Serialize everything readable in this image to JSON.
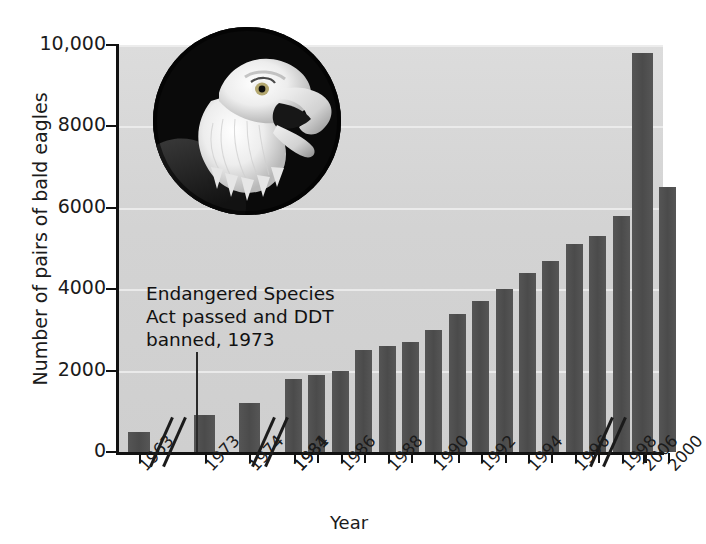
{
  "chart_data": {
    "type": "bar",
    "title": "",
    "xlabel": "Year",
    "ylabel": "Number of pairs of bald eagles",
    "ylim": [
      0,
      10000
    ],
    "yticks": [
      "0",
      "2000",
      "4000",
      "6000",
      "8000",
      "10,000"
    ],
    "ytick_values": [
      0,
      2000,
      4000,
      6000,
      8000,
      10000
    ],
    "grid": true,
    "legend": "none",
    "categories": [
      "1963",
      "1973",
      "1974",
      "1981",
      "1984",
      "1986",
      "1988",
      "1990",
      "1992",
      "1994",
      "1996",
      "1998",
      "2000",
      "2006"
    ],
    "tick_labels": [
      "1963",
      "1973",
      "1974",
      "1981",
      "1984",
      "1986",
      "1988",
      "1990",
      "1992",
      "1994",
      "1996",
      "1998",
      "2000",
      "2006"
    ],
    "values": [
      500,
      null,
      900,
      1200,
      1800,
      1900,
      2500,
      3000,
      3700,
      4400,
      5100,
      5800,
      6400,
      9800
    ],
    "bar_points": [
      {
        "year": "1963",
        "value": 500
      },
      {
        "year": "1974",
        "value": 900
      },
      {
        "year": "1981",
        "value": 1200
      },
      {
        "year": "1984",
        "value": 1800
      },
      {
        "year": "1985",
        "value": 1900
      },
      {
        "year": "1986",
        "value": 2000
      },
      {
        "year": "1987",
        "value": 2500
      },
      {
        "year": "1988",
        "value": 2600
      },
      {
        "year": "1989",
        "value": 2700
      },
      {
        "year": "1990",
        "value": 3000
      },
      {
        "year": "1991",
        "value": 3400
      },
      {
        "year": "1992",
        "value": 3700
      },
      {
        "year": "1993",
        "value": 4000
      },
      {
        "year": "1994",
        "value": 4400
      },
      {
        "year": "1995",
        "value": 4700
      },
      {
        "year": "1996",
        "value": 5100
      },
      {
        "year": "1997",
        "value": 5300
      },
      {
        "year": "1998",
        "value": 5800
      },
      {
        "year": "1999",
        "value": 6300
      },
      {
        "year": "2000",
        "value": 6500
      },
      {
        "year": "2006",
        "value": 9800
      }
    ],
    "annotations": [
      {
        "text": "Endangered Species Act passed and DDT banned, 1973",
        "at_year": "1973"
      }
    ],
    "axis_breaks": [
      "between 1963 and 1973",
      "between 1974 and 1981",
      "between 2000 and 2006"
    ],
    "colors": {
      "bar": "#4b4b4b",
      "plot_background": "#d3d3d3",
      "grid": "#efefef",
      "axis": "#111111",
      "text": "#1b1b1b"
    }
  },
  "annotation": {
    "line1": "Endangered Species",
    "line2": "Act passed and DDT",
    "line3": "banned, 1973"
  },
  "inset": {
    "caption": "bald-eagle-photograph"
  }
}
